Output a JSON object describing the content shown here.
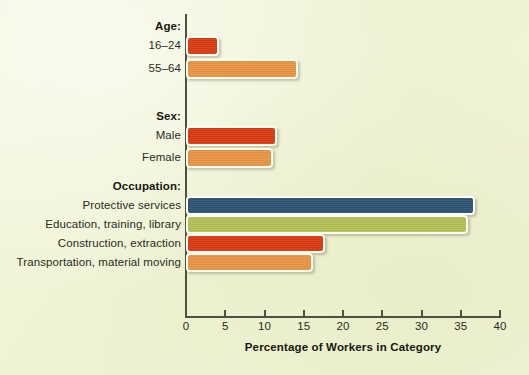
{
  "chart_data": {
    "type": "bar",
    "orientation": "horizontal",
    "title": "",
    "xlabel": "Percentage of Workers in Category",
    "ylabel": "",
    "xlim": [
      0,
      40
    ],
    "xticks": [
      0,
      5,
      10,
      15,
      20,
      25,
      30,
      35,
      40
    ],
    "xtick_labels": [
      "0",
      "5",
      "10",
      "15",
      "20",
      "25",
      "30",
      "35",
      "40"
    ],
    "grid": false,
    "legend": "none",
    "groups": [
      {
        "name": "Age:",
        "categories": [
          "16–24",
          "55–64"
        ],
        "values": [
          4,
          14
        ],
        "colors": [
          "#d93b13",
          "#e89545"
        ]
      },
      {
        "name": "Sex:",
        "categories": [
          "Male",
          "Female"
        ],
        "values": [
          11.3,
          10.8
        ],
        "colors": [
          "#d93b13",
          "#e89545"
        ]
      },
      {
        "name": "Occupation:",
        "categories": [
          "Protective services",
          "Education, training, library",
          "Construction, extraction",
          "Transportation, material moving"
        ],
        "values": [
          36.5,
          35.7,
          17.5,
          15.9
        ],
        "colors": [
          "#2d5475",
          "#b5c057",
          "#d93b13",
          "#e89545"
        ]
      }
    ],
    "categories": [
      "16–24",
      "55–64",
      "Male",
      "Female",
      "Protective services",
      "Education, training, library",
      "Construction, extraction",
      "Transportation, material moving"
    ],
    "values": [
      4,
      14,
      11.3,
      10.8,
      36.5,
      35.7,
      17.5,
      15.9
    ]
  },
  "bars": [
    {
      "label": "16–24",
      "value": 4,
      "color": "#d93b13",
      "top": 36,
      "height": 20
    },
    {
      "label": "55–64",
      "value": 14,
      "color": "#e89545",
      "top": 59,
      "height": 20
    },
    {
      "label": "Male",
      "value": 11.3,
      "color": "#d93b13",
      "top": 126,
      "height": 20
    },
    {
      "label": "Female",
      "value": 10.8,
      "color": "#e89545",
      "top": 148,
      "height": 20
    },
    {
      "label": "Protective services",
      "value": 36.5,
      "color": "#2d5475",
      "top": 196,
      "height": 19
    },
    {
      "label": "Education, training, library",
      "value": 35.7,
      "color": "#b5c057",
      "top": 215,
      "height": 19
    },
    {
      "label": "Construction, extraction",
      "value": 17.5,
      "color": "#d93b13",
      "top": 234,
      "height": 19
    },
    {
      "label": "Transportation, material moving",
      "value": 15.9,
      "color": "#e89545",
      "top": 253,
      "height": 19
    }
  ],
  "group_heads": [
    {
      "text": "Age:",
      "top": 20
    },
    {
      "text": "Sex:",
      "top": 110
    },
    {
      "text": "Occupation:",
      "top": 180
    }
  ],
  "axis": {
    "title": "Percentage of Workers in Category",
    "ticks": [
      "0",
      "5",
      "10",
      "15",
      "20",
      "25",
      "30",
      "35",
      "40"
    ],
    "line_color": "#4f5140"
  },
  "colors": {
    "background": "#f1f4d7",
    "red": "#d93b13",
    "orange": "#e89545",
    "blue": "#2d5475",
    "olive": "#b5c057",
    "text": "#2a2b22",
    "bar_outline": "#fdfdf2"
  }
}
